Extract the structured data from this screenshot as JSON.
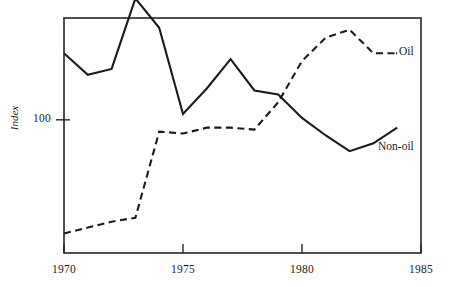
{
  "chart_data": {
    "type": "line",
    "title": "",
    "xlabel": "",
    "ylabel": "Index",
    "xlim": [
      1970,
      1985
    ],
    "ylim": [
      32,
      152
    ],
    "grid": false,
    "legend_position": "right-inline",
    "x_ticks": [
      "1970",
      "1975",
      "1980",
      "1985"
    ],
    "y_ticks": [
      "100"
    ],
    "y_tick_values": [
      100
    ],
    "x": [
      1970,
      1971,
      1972,
      1973,
      1974,
      1975,
      1976,
      1977,
      1978,
      1979,
      1980,
      1981,
      1982,
      1983,
      1984
    ],
    "series": [
      {
        "name": "Oil",
        "style": "dashed",
        "color": "#1a1a1a",
        "values": [
          42,
          45,
          48,
          50,
          94,
          93,
          96,
          96,
          95,
          109,
          130,
          142,
          146,
          134,
          134
        ]
      },
      {
        "name": "Non-oil",
        "style": "solid",
        "color": "#1a1a1a",
        "values": [
          134,
          123,
          126,
          162,
          147,
          103,
          116,
          131,
          115,
          113,
          101,
          92,
          84,
          88,
          96
        ]
      }
    ]
  },
  "labels": {
    "oil": "Oil",
    "non_oil": "Non-oil",
    "y_axis_title": "Index",
    "y_tick_100": "100",
    "x_tick_1970": "1970",
    "x_tick_1975": "1975",
    "x_tick_1980": "1980",
    "x_tick_1985": "1985"
  },
  "colors": {
    "ink": "#1a1a1a",
    "frame": "#262626",
    "background": "#ffffff"
  }
}
